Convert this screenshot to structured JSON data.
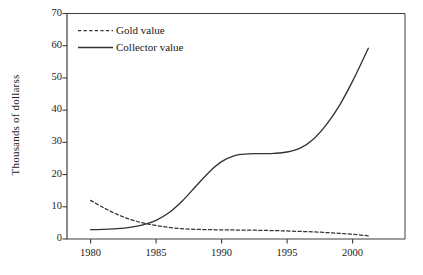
{
  "chart_data": {
    "type": "line",
    "title": "",
    "xlabel": "",
    "ylabel": "Thousands of dollarss",
    "xlim": [
      1978.2,
      2004.0
    ],
    "ylim": [
      0,
      70
    ],
    "grid": false,
    "legend_position": "top-left",
    "xticks": [
      1980,
      1985,
      1990,
      1995,
      2000
    ],
    "xtick_labels": [
      "1980",
      "1985",
      "1990",
      "1995",
      "2000"
    ],
    "yticks": [
      0,
      10,
      20,
      30,
      40,
      50,
      60,
      70
    ],
    "ytick_labels": [
      "0",
      "10",
      "20",
      "30",
      "40",
      "50",
      "60",
      "70"
    ],
    "series": [
      {
        "name": "Gold value",
        "style": "dashed",
        "color": "#333333",
        "x": [
          1980,
          1981,
          1982,
          1983,
          1984,
          1985,
          1986,
          1987,
          1988,
          1989,
          1990,
          1991,
          1992,
          1993,
          1994,
          1995,
          1996,
          1997,
          1998,
          1999,
          2000,
          2001.2
        ],
        "values": [
          12.0,
          9.7,
          7.7,
          6.1,
          5.0,
          4.2,
          3.6,
          3.2,
          3.0,
          2.9,
          2.85,
          2.8,
          2.75,
          2.7,
          2.6,
          2.5,
          2.35,
          2.2,
          2.0,
          1.75,
          1.45,
          1.0
        ]
      },
      {
        "name": "Collector value",
        "style": "solid",
        "color": "#333333",
        "x": [
          1980,
          1981,
          1982,
          1983,
          1984,
          1985,
          1986,
          1987,
          1988,
          1989,
          1990,
          1991,
          1992,
          1993,
          1994,
          1995,
          1996,
          1997,
          1998,
          1999,
          2000,
          2001.2
        ],
        "values": [
          2.9,
          3.0,
          3.2,
          3.6,
          4.4,
          5.8,
          8.2,
          11.8,
          16.2,
          20.6,
          24.0,
          25.9,
          26.4,
          26.5,
          26.6,
          27.0,
          28.2,
          31.0,
          35.5,
          41.5,
          49.0,
          59.2
        ]
      }
    ]
  },
  "legend": {
    "entries": [
      {
        "label": "Gold value"
      },
      {
        "label": "Collector value"
      }
    ]
  },
  "axes": {
    "y_title": "Thousands of dollarss"
  }
}
